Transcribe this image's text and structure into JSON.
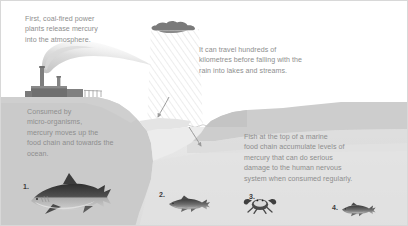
{
  "figure": {
    "background_color": "#ffffff"
  },
  "captions": {
    "emission": {
      "text": "First, coal-fired power\nplants release mercury\ninto the atmosphere.",
      "color": "#8e8e8e"
    },
    "travel": {
      "text": "It can travel hundreds of\nkilometres before falling with the\nrain into lakes and streams.",
      "color": "#8e8e8e"
    },
    "consumed": {
      "text": "Consumed by\nmicro-organisms,\nmercury moves up the\nfood chain and towards the\nocean.",
      "color": "#8e8e8e"
    },
    "fish": {
      "text": "Fish at the top of a marine\nfood chain accumulate levels of\nmercury that can do serious\ndamage to the human nervous\nsystem when consumed regularly.",
      "color": "#8e8e8e"
    }
  },
  "creatures": [
    {
      "number": "1.",
      "name": "shark",
      "label": "1."
    },
    {
      "number": "2.",
      "name": "medium-fish",
      "label": "2."
    },
    {
      "number": "3.",
      "name": "crab",
      "label": "3."
    },
    {
      "number": "4.",
      "name": "small-fish",
      "label": "4."
    }
  ],
  "palette": {
    "sky": "#ffffff",
    "land": "#c9c9c9",
    "land_light": "#d4d4d4",
    "water": "#e4e4e4",
    "water_deep": "#dedede",
    "cloud": "#7a7a7a",
    "rain": "#d2d2d2",
    "smoke": "#cfcfcf",
    "plant": "#8c8c8c",
    "plant_dark": "#6e6e6e",
    "arrow": "#9a9a9a",
    "creature_dark": "#3f3f3f",
    "creature_light": "#9a9a9a",
    "text": "#8e8e8e",
    "number": "#3a3a3a"
  }
}
